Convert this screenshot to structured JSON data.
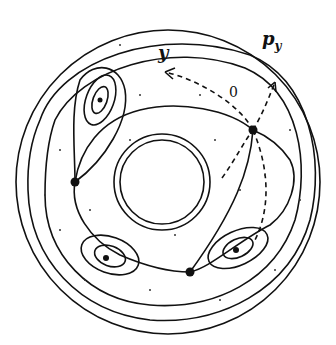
{
  "diagram": {
    "type": "phase-portrait-annulus",
    "labels": {
      "y": "y",
      "py": "p",
      "py_sub": "y",
      "origin": "0"
    },
    "colors": {
      "ink": "#111111",
      "background": "#ffffff"
    },
    "fixed_points": {
      "hyperbolic": 3,
      "elliptic": 3
    }
  }
}
